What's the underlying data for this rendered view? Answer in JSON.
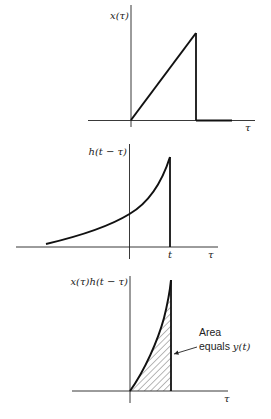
{
  "figure": {
    "panels": [
      {
        "id": "input-signal",
        "ylabel": "x(τ)",
        "xlabel": "τ",
        "shape": "ramp from origin to peak, then drops to zero"
      },
      {
        "id": "flipped-shifted-impulse-response",
        "ylabel": "h(t − τ)",
        "xlabel": "τ",
        "tick_label": "t",
        "shape": "exponential rising to peak at τ = t, then drops to zero"
      },
      {
        "id": "product",
        "ylabel": "x(τ)h(t − τ)",
        "xlabel": "τ",
        "shape": "product curve from origin to τ = t, shaded area",
        "annotation": {
          "line1": "Area",
          "line2_prefix": "equals ",
          "line2_math": "y(t)"
        }
      }
    ]
  }
}
